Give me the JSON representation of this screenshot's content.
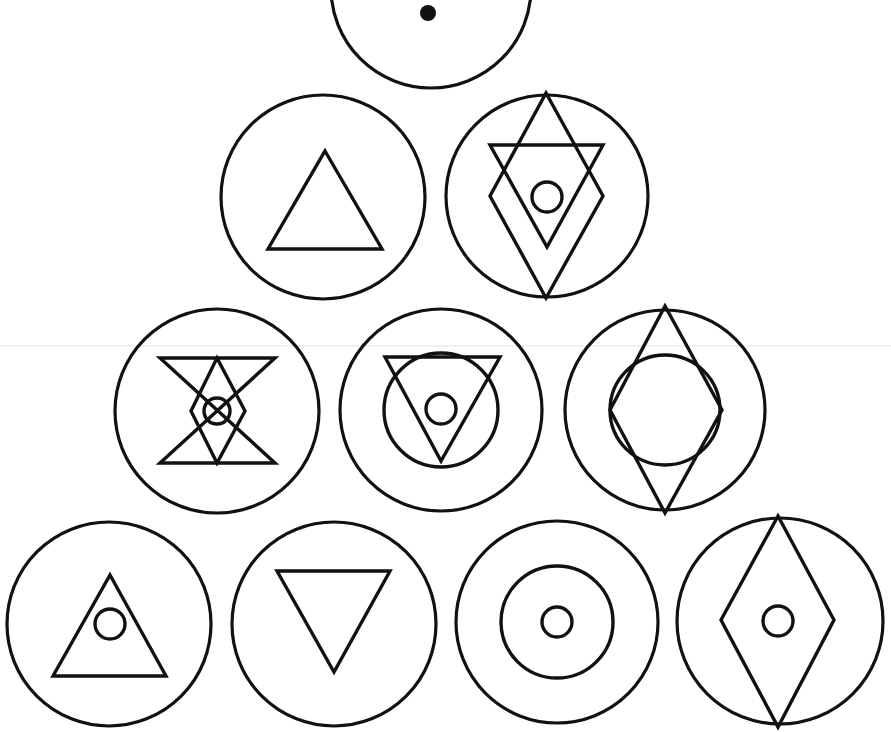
{
  "diagram": {
    "title": "Alchemical symbols arranged in a pyramid",
    "layout": "pyramid",
    "rows": [
      1,
      2,
      3,
      4
    ],
    "colors": {
      "ink": "#111111",
      "background": "#ffffff",
      "scanline": "#e3e3e3"
    },
    "symbols": [
      {
        "id": 1,
        "row": 1,
        "label": "Circle with central point",
        "elements": [
          "outer-circle",
          "center-dot"
        ]
      },
      {
        "id": 2,
        "row": 2,
        "label": "Circle with upward triangle",
        "elements": [
          "outer-circle",
          "up-triangle"
        ]
      },
      {
        "id": 3,
        "row": 2,
        "label": "Circle with diamond, downward triangle and small circle",
        "elements": [
          "outer-circle",
          "diamond",
          "down-triangle",
          "small-circle"
        ]
      },
      {
        "id": 4,
        "row": 3,
        "label": "Circle with hourglass, diamond and small circle",
        "elements": [
          "outer-circle",
          "hourglass",
          "diamond",
          "small-circle"
        ]
      },
      {
        "id": 5,
        "row": 3,
        "label": "Circle with downward triangle, middle circle and small circle",
        "elements": [
          "outer-circle",
          "down-triangle",
          "middle-circle",
          "small-circle"
        ]
      },
      {
        "id": 6,
        "row": 3,
        "label": "Circle with diamond and inner circle",
        "elements": [
          "outer-circle",
          "diamond",
          "inner-circle"
        ]
      },
      {
        "id": 7,
        "row": 4,
        "label": "Circle with upward triangle and small circle",
        "elements": [
          "outer-circle",
          "up-triangle",
          "small-circle"
        ]
      },
      {
        "id": 8,
        "row": 4,
        "label": "Circle with downward triangle",
        "elements": [
          "outer-circle",
          "down-triangle"
        ]
      },
      {
        "id": 9,
        "row": 4,
        "label": "Concentric circles",
        "elements": [
          "outer-circle",
          "middle-circle",
          "small-circle"
        ]
      },
      {
        "id": 10,
        "row": 4,
        "label": "Circle with diamond and small circle",
        "elements": [
          "outer-circle",
          "diamond",
          "small-circle"
        ]
      }
    ]
  }
}
